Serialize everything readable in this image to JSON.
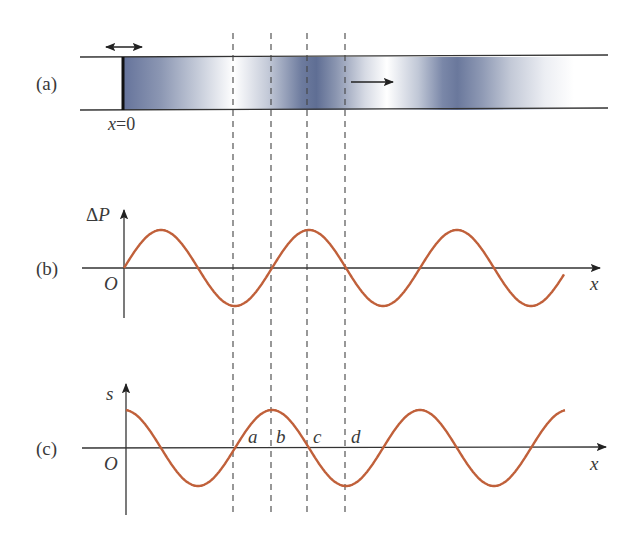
{
  "panels": {
    "a": {
      "label": "(a)",
      "origin_label": "x=0",
      "origin_var": "x",
      "origin_eq": "=0"
    },
    "b": {
      "label": "(b)",
      "y_axis": "ΔP",
      "y_axis_delta": "Δ",
      "y_axis_var": "P",
      "origin": "O",
      "x_axis": "x"
    },
    "c": {
      "label": "(c)",
      "y_axis": "s",
      "origin": "O",
      "x_axis": "x",
      "points": [
        "a",
        "b",
        "c",
        "d"
      ]
    }
  },
  "colors": {
    "curve": "#c0603a",
    "axis": "#333333",
    "tube_dark": "#5a6a8e",
    "tube_light": "#ffffff",
    "dashed": "#444444"
  },
  "geometry": {
    "origin_x": 124,
    "wavelength_px": 148,
    "amplitude_px": 38,
    "dashed_x": [
      233,
      271,
      307,
      345
    ]
  }
}
